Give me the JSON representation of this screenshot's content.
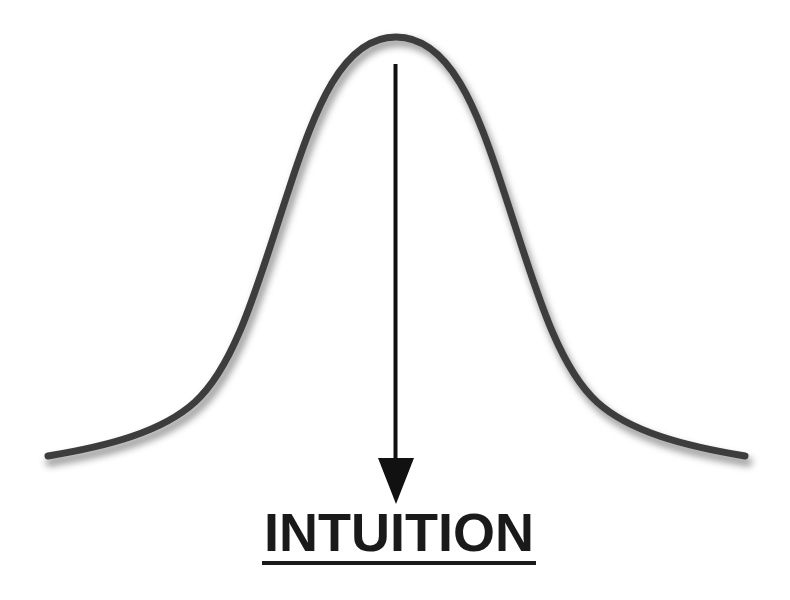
{
  "diagram": {
    "type": "bell-curve",
    "label": "INTUITION",
    "arrow_direction": "down",
    "colors": {
      "curve": "#3d3d3d",
      "curve_shadow": "#9a9a9a",
      "arrow": "#111111",
      "label": "#1a1a1a",
      "background": "#ffffff"
    }
  }
}
